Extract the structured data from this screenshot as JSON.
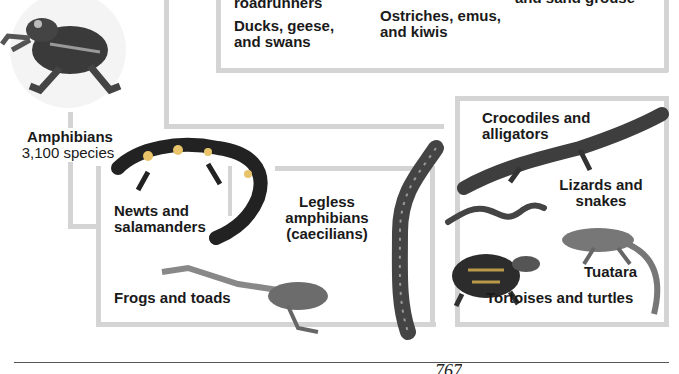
{
  "birds": {
    "labels": {
      "roadrunners": "roadrunners",
      "ducks": "Ducks, geese,\nand swans",
      "ostriches": "Ostriches, emus,\nand kiwis",
      "sandgrouse": "and sand grouse"
    }
  },
  "amphibians": {
    "title": "Amphibians",
    "count": "3,100 species",
    "groups": {
      "newts": "Newts and\nsalamanders",
      "frogs": "Frogs and toads",
      "caecilians": "Legless\namphibians\n(caecilians)"
    }
  },
  "reptiles": {
    "groups": {
      "crocodiles": "Crocodiles and\nalligators",
      "lizards": "Lizards and\nsnakes",
      "tuatara": "Tuatara",
      "turtles": "Tortoises and turtles"
    }
  },
  "page": {
    "number": "767"
  },
  "colors": {
    "connector": "#d4d4d4",
    "text": "#1a1a1a"
  }
}
